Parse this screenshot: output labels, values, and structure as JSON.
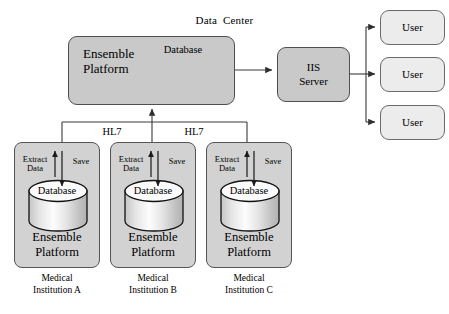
{
  "diagram": {
    "title_visible": false,
    "data_center": {
      "title": "Data  Center",
      "platform_label": "Ensemble\nPlatform",
      "platform_line1": "Ensemble",
      "platform_line2": "Platform",
      "database_label": "Database",
      "internal_arrow": "bidirectional"
    },
    "iis_server": {
      "line1": "IIS",
      "line2": "Server"
    },
    "users": [
      {
        "label": "User"
      },
      {
        "label": "User"
      },
      {
        "label": "User"
      }
    ],
    "protocol_labels": [
      {
        "text": "HL7"
      },
      {
        "text": "HL7"
      }
    ],
    "institutions": [
      {
        "caption_line1": "Medical",
        "caption_line2": "Institution A",
        "database_label": "Database",
        "platform_line1": "Ensemble",
        "platform_line2": "Platform",
        "extract_line1": "Extract",
        "extract_line2": "Data",
        "save_label": "Save"
      },
      {
        "caption_line1": "Medical",
        "caption_line2": "Institution B",
        "database_label": "Database",
        "platform_line1": "Ensemble",
        "platform_line2": "Platform",
        "extract_line1": "Extract",
        "extract_line2": "Data",
        "save_label": "Save"
      },
      {
        "caption_line1": "Medical",
        "caption_line2": "Institution C",
        "database_label": "Database",
        "platform_line1": "Ensemble",
        "platform_line2": "Platform",
        "extract_line1": "Extract",
        "extract_line2": "Data",
        "save_label": "Save"
      }
    ],
    "colors": {
      "node_fill": "#d2d2d2",
      "user_fill": "#ececec",
      "server_fill": "#c9c9c9",
      "stroke": "#555555",
      "line": "#3a3a3a",
      "cylinder_top": "#f7f7f7",
      "background": "#ffffff"
    }
  }
}
